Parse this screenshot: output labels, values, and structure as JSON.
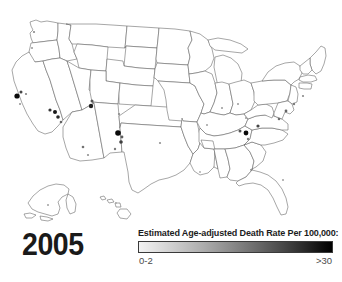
{
  "figure": {
    "year": "2005",
    "map_name": "united-states-county-choropleth"
  },
  "legend": {
    "title": "Estimated Age-adjusted Death Rate Per 100,000:",
    "min_label": "0-2",
    "max_label": ">30",
    "ramp_low_color": "#f2f2f2",
    "ramp_high_color": "#000000"
  },
  "chart_data": {
    "type": "heatmap",
    "title": "Estimated Age-adjusted Death Rate Per 100,000:",
    "subtitle": "2005",
    "xlabel": "",
    "ylabel": "",
    "legend_position": "bottom-right",
    "grid": false,
    "colorbar": {
      "min_label": "0-2",
      "max_label": ">30",
      "min_value": 0,
      "max_value": 30,
      "colors": [
        "#f2f2f2",
        "#bfbfbf",
        "#8a8a8a",
        "#545454",
        "#000000"
      ]
    },
    "regions": [
      {
        "name": "Alaska",
        "inset": true
      },
      {
        "name": "Hawaii",
        "inset": true
      }
    ],
    "markers": [
      {
        "region": "California - San Francisco Bay Area",
        "x": 17,
        "y": 96,
        "r": 2.6,
        "value": 30
      },
      {
        "region": "California - Bay Area north",
        "x": 21,
        "y": 92,
        "r": 1.5,
        "value": 22
      },
      {
        "region": "California - Sacramento",
        "x": 26,
        "y": 94,
        "r": 1.1,
        "value": 14
      },
      {
        "region": "California - central coast",
        "x": 20,
        "y": 104,
        "r": 1.0,
        "value": 12
      },
      {
        "region": "Nevada - Clark County",
        "x": 55,
        "y": 112,
        "r": 2.0,
        "value": 28
      },
      {
        "region": "Nevada - Nye County",
        "x": 50,
        "y": 110,
        "r": 1.6,
        "value": 24
      },
      {
        "region": "Nevada - Washoe",
        "x": 58,
        "y": 117,
        "r": 1.8,
        "value": 26
      },
      {
        "region": "Nevada - southern",
        "x": 61,
        "y": 122,
        "r": 1.3,
        "value": 18
      },
      {
        "region": "Utah - Salt Lake",
        "x": 92,
        "y": 101,
        "r": 1.5,
        "value": 20
      },
      {
        "region": "Utah - central",
        "x": 91,
        "y": 106,
        "r": 2.2,
        "value": 27
      },
      {
        "region": "Colorado - Denver",
        "x": 119,
        "y": 114,
        "r": 1.1,
        "value": 13
      },
      {
        "region": "New Mexico - Rio Arriba",
        "x": 118,
        "y": 133,
        "r": 2.8,
        "value": 32
      },
      {
        "region": "New Mexico - Santa Fe",
        "x": 122,
        "y": 137,
        "r": 1.4,
        "value": 19
      },
      {
        "region": "New Mexico - Bernalillo",
        "x": 121,
        "y": 142,
        "r": 1.8,
        "value": 23
      },
      {
        "region": "New Mexico - southern",
        "x": 115,
        "y": 149,
        "r": 1.2,
        "value": 15
      },
      {
        "region": "Arizona - Maricopa",
        "x": 83,
        "y": 147,
        "r": 1.3,
        "value": 16
      },
      {
        "region": "Arizona - Pima",
        "x": 88,
        "y": 155,
        "r": 1.1,
        "value": 12
      },
      {
        "region": "Kentucky - eastern",
        "x": 246,
        "y": 133,
        "r": 2.4,
        "value": 30
      },
      {
        "region": "Kentucky - central",
        "x": 240,
        "y": 131,
        "r": 1.5,
        "value": 20
      },
      {
        "region": "West Virginia",
        "x": 258,
        "y": 126,
        "r": 1.6,
        "value": 22
      },
      {
        "region": "Tennessee - eastern",
        "x": 248,
        "y": 139,
        "r": 1.2,
        "value": 14
      },
      {
        "region": "Ohio",
        "x": 246,
        "y": 118,
        "r": 1.0,
        "value": 11
      },
      {
        "region": "Pennsylvania - Philadelphia",
        "x": 286,
        "y": 111,
        "r": 1.4,
        "value": 18
      },
      {
        "region": "Maryland - Baltimore",
        "x": 279,
        "y": 119,
        "r": 1.3,
        "value": 17
      },
      {
        "region": "New York City",
        "x": 294,
        "y": 104,
        "r": 1.2,
        "value": 15
      },
      {
        "region": "Massachusetts - Boston",
        "x": 303,
        "y": 96,
        "r": 1.1,
        "value": 13
      },
      {
        "region": "Michigan - Detroit",
        "x": 238,
        "y": 104,
        "r": 1.0,
        "value": 11
      },
      {
        "region": "Illinois - Chicago",
        "x": 222,
        "y": 108,
        "r": 1.0,
        "value": 11
      },
      {
        "region": "Missouri - St. Louis",
        "x": 207,
        "y": 125,
        "r": 1.0,
        "value": 10
      },
      {
        "region": "Oklahoma",
        "x": 160,
        "y": 143,
        "r": 1.1,
        "value": 12
      },
      {
        "region": "Louisiana - New Orleans",
        "x": 200,
        "y": 172,
        "r": 0.9,
        "value": 9
      },
      {
        "region": "Florida - central",
        "x": 283,
        "y": 180,
        "r": 1.0,
        "value": 10
      },
      {
        "region": "Washington - Seattle",
        "x": 34,
        "y": 32,
        "r": 1.1,
        "value": 13
      },
      {
        "region": "Oregon - Portland",
        "x": 32,
        "y": 48,
        "r": 1.0,
        "value": 11
      },
      {
        "region": "Alaska - Anchorage",
        "x": 48,
        "y": 205,
        "r": 1.0,
        "value": 10
      },
      {
        "region": "Hawaii - Oahu",
        "x": 116,
        "y": 203,
        "r": 0.9,
        "value": 9
      }
    ]
  }
}
